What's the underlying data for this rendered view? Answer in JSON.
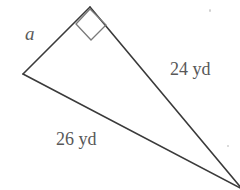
{
  "figure": {
    "type": "geometry-diagram",
    "shape": "right-triangle",
    "background_color": "#ffffff",
    "stroke_color": "#3a3a3a",
    "text_color": "#585858",
    "canvas": {
      "width": 240,
      "height": 190
    },
    "vertices": {
      "apex": {
        "x": 90,
        "y": 7,
        "angle": "right"
      },
      "left": {
        "x": 23,
        "y": 74
      },
      "bottom_right": {
        "x": 242,
        "y": 189
      }
    },
    "right_angle_marker": {
      "name": "right-angle-square",
      "points": "76,24 90,9 106,25 91,40"
    },
    "labels": {
      "unknown_side": "a",
      "leg_label": "24 yd",
      "hypotenuse_label": "26 yd"
    }
  }
}
